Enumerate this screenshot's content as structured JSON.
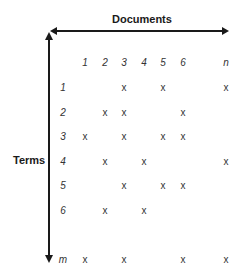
{
  "diagram": {
    "title_horizontal": "Documents",
    "title_vertical": "Terms",
    "columns": [
      "1",
      "2",
      "3",
      "4",
      "5",
      "6",
      "n"
    ],
    "rows": [
      {
        "label": "1",
        "marks": [
          false,
          false,
          true,
          false,
          true,
          false,
          true
        ]
      },
      {
        "label": "2",
        "marks": [
          false,
          true,
          true,
          false,
          false,
          true,
          false
        ]
      },
      {
        "label": "3",
        "marks": [
          true,
          false,
          true,
          false,
          true,
          true,
          false
        ]
      },
      {
        "label": "4",
        "marks": [
          false,
          true,
          false,
          true,
          false,
          false,
          true
        ]
      },
      {
        "label": "5",
        "marks": [
          false,
          false,
          true,
          false,
          true,
          true,
          false
        ]
      },
      {
        "label": "6",
        "marks": [
          false,
          true,
          false,
          true,
          false,
          false,
          false
        ]
      },
      {
        "label": "m",
        "marks": [
          true,
          false,
          true,
          false,
          false,
          true,
          true
        ]
      }
    ],
    "mark_symbol": "x"
  }
}
